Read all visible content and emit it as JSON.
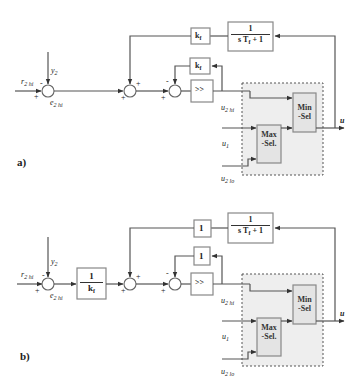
{
  "diagrams": [
    {
      "id": "a",
      "label": "a)",
      "signals": {
        "reference": "r",
        "reference_sub": "2 hi",
        "measurement": "y",
        "measurement_sub": "2",
        "error": "e",
        "error_sub": "2 hi",
        "u2hi": "u",
        "u2hi_sub": "2 hi",
        "u1": "u",
        "u1_sub": "1",
        "u2lo": "u",
        "u2lo_sub": "2 lo",
        "output": "u"
      },
      "sum1_signs": {
        "left": "+",
        "top": "-"
      },
      "sum2_signs": {
        "left": "+",
        "top": "+"
      },
      "sum3_signs": {
        "left": "+",
        "top": "-"
      },
      "pre_gain": null,
      "outer_gain": {
        "main": "k",
        "sub": "f"
      },
      "inner_gain": {
        "main": "k",
        "sub": "f"
      },
      "controller": ">>",
      "filter": {
        "num": "1",
        "den_a": "s T",
        "den_sub": "f",
        "den_b": " + 1"
      },
      "max_select": {
        "line1": "Max",
        "line2": "-Sel."
      },
      "min_select": {
        "line1": "Min",
        "line2": "-Sel"
      }
    },
    {
      "id": "b",
      "label": "b)",
      "signals": {
        "reference": "r",
        "reference_sub": "2 hi",
        "measurement": "y",
        "measurement_sub": "2",
        "error": "e",
        "error_sub": "2 hi",
        "u2hi": "u",
        "u2hi_sub": "2 hi",
        "u1": "u",
        "u1_sub": "1",
        "u2lo": "u",
        "u2lo_sub": "2 lo",
        "output": "u"
      },
      "sum1_signs": {
        "left": "+",
        "top": "-"
      },
      "sum2_signs": {
        "left": "+",
        "top": "+"
      },
      "sum3_signs": {
        "left": "+",
        "top": "-"
      },
      "pre_gain": {
        "num": "1",
        "den_main": "k",
        "den_sub": "f"
      },
      "outer_gain": {
        "main": "1",
        "sub": ""
      },
      "inner_gain": {
        "main": "1",
        "sub": ""
      },
      "controller": ">>",
      "filter": {
        "num": "1",
        "den_a": "s T",
        "den_sub": "f",
        "den_b": " + 1"
      },
      "max_select": {
        "line1": "Max",
        "line2": "-Sel."
      },
      "min_select": {
        "line1": "Min",
        "line2": "-Sel"
      }
    }
  ],
  "colors": {
    "wire": "#555555",
    "block_border": "#888888",
    "selector_fill": "#e4e4e4",
    "group_fill": "#eeeeee"
  }
}
